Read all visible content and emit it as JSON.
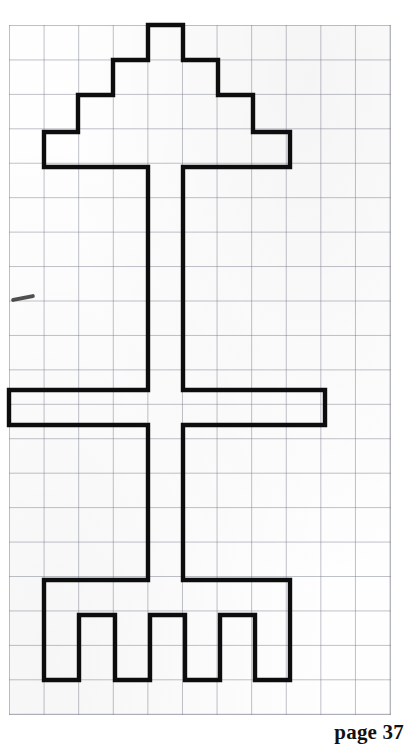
{
  "page": {
    "width": 412,
    "height": 749,
    "background_color": "#ffffff",
    "label": "page 37"
  },
  "grid": {
    "name": "graph-paper",
    "origin_x": 9,
    "origin_y": 25,
    "cell_width": 34.6,
    "cell_height": 34.45,
    "columns": 11,
    "rows": 20,
    "line_color": "#787d8c",
    "paper_color": "#fefefe"
  },
  "drawing": {
    "title": "Grid figure: stepped pyramid on a post with a crossbar and a four-tooth rake base",
    "stroke_color": "#0d0d0d",
    "stroke_width": 4.4,
    "shapes": [
      {
        "name": "pyramid-tier-1",
        "description": "Topmost block, 1 cell wide, 1 cell tall",
        "grid_x": 4,
        "grid_y": 0,
        "grid_w": 1,
        "grid_h": 1
      },
      {
        "name": "pyramid-tier-2",
        "description": "Second block, 3 cells wide, 1 cell tall",
        "grid_x": 3,
        "grid_y": 1,
        "grid_w": 3,
        "grid_h": 1
      },
      {
        "name": "pyramid-tier-3",
        "description": "Third block, 5 cells wide, 1 cell tall",
        "grid_x": 2,
        "grid_y": 2,
        "grid_w": 5,
        "grid_h": 1
      },
      {
        "name": "pyramid-tier-4",
        "description": "Fourth block, 7 cells wide, 1 cell tall",
        "grid_x": 1,
        "grid_y": 3,
        "grid_w": 7,
        "grid_h": 1
      },
      {
        "name": "vertical-post",
        "description": "Central stem, 1 cell wide, running from under the pyramid down to the rake bar",
        "grid_x": 4,
        "grid_y": 4,
        "grid_w": 1,
        "grid_h": 12
      },
      {
        "name": "horizontal-crossbar",
        "description": "Wide crossbar, 9 cells wide, 1 cell tall, crossing the post",
        "grid_x": 0,
        "grid_y": 10.6,
        "grid_w": 9,
        "grid_h": 1
      },
      {
        "name": "rake-bar",
        "description": "Bottom horizontal bar of the rake, 7 cells wide, 1 cell tall",
        "grid_x": 1,
        "grid_y": 16.1,
        "grid_w": 7,
        "grid_h": 1
      },
      {
        "name": "rake-tooth-1",
        "description": "First rake tooth, 1 cell wide, 2 cells tall",
        "grid_x": 1,
        "grid_y": 17.1,
        "grid_w": 1,
        "grid_h": 1.9
      },
      {
        "name": "rake-tooth-2",
        "description": "Second rake tooth, 1 cell wide, 2 cells tall",
        "grid_x": 3,
        "grid_y": 17.1,
        "grid_w": 1,
        "grid_h": 1.9
      },
      {
        "name": "rake-tooth-3",
        "description": "Third rake tooth, 1 cell wide, 2 cells tall",
        "grid_x": 5,
        "grid_y": 17.1,
        "grid_w": 1,
        "grid_h": 1.9
      },
      {
        "name": "rake-tooth-4",
        "description": "Fourth rake tooth, 1 cell wide, 2 cells tall",
        "grid_x": 7,
        "grid_y": 17.1,
        "grid_w": 1,
        "grid_h": 1.9
      }
    ],
    "outline_path": "M148,25 L183,25 L183,60 L218,60 L218,95 L253,95 L253,132 L290,132 L290,167 L183,167 L183,390 L325,390 L325,425 L183,425 L183,580 L290,580 L290,615 L290,680 L255,680 L255,615 L220,615 L220,680 L185,680 L185,615 L150,615 L150,680 L115,680 L115,615 L79,615 L79,680 L44,680 L44,615 L44,580 L148,580 L148,425 L9,425 L9,390 L148,390 L148,167 L44,167 L44,132 L78,132 L78,95 L113,95 L113,60 L148,60 Z"
  },
  "annotations": {
    "stray_pencil_mark": {
      "name": "stray-pencil-mark",
      "description": "Short diagonal smudge at the left margin",
      "x": 11,
      "y": 296
    }
  }
}
